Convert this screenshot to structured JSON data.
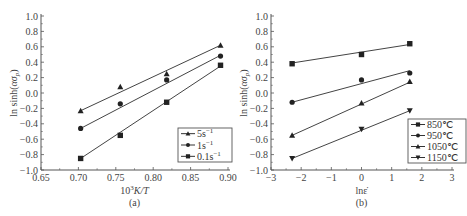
{
  "chart_data": [
    {
      "type": "scatter",
      "panel_label": "(a)",
      "title": "",
      "xlabel": "10^3 K/T",
      "ylabel": "ln sinh(ασp)",
      "xlim": [
        0.65,
        0.9
      ],
      "ylim": [
        -1.0,
        1.0
      ],
      "xticks": [
        "0.65",
        "0.70",
        "0.75",
        "0.80",
        "0.85",
        "0.90"
      ],
      "yticks": [
        "-1.0",
        "-0.8",
        "-0.6",
        "-0.4",
        "-0.2",
        "0.0",
        "0.2",
        "0.4",
        "0.6",
        "0.8",
        "1.0"
      ],
      "x": [
        0.703,
        0.756,
        0.818,
        0.89
      ],
      "series": [
        {
          "name": "5s-1",
          "marker": "triangle-up",
          "values": [
            -0.23,
            0.08,
            0.25,
            0.62
          ],
          "fit": [
            -0.23,
            0.02,
            0.31,
            0.62
          ]
        },
        {
          "name": "1s-1",
          "marker": "circle",
          "values": [
            -0.46,
            -0.14,
            0.17,
            0.48
          ],
          "fit": [
            -0.46,
            -0.19,
            0.14,
            0.49
          ]
        },
        {
          "name": "0.1s-1",
          "marker": "square",
          "values": [
            -0.85,
            -0.55,
            -0.12,
            0.36
          ],
          "fit": [
            -0.85,
            -0.54,
            -0.15,
            0.35
          ]
        }
      ],
      "legend_position": "lower right",
      "grid": false
    },
    {
      "type": "scatter",
      "panel_label": "(b)",
      "title": "",
      "xlabel": "lnε̇",
      "ylabel": "ln sinh(ασp)",
      "xlim": [
        -3,
        3
      ],
      "ylim": [
        -1.0,
        1.0
      ],
      "xticks": [
        "-3",
        "-2",
        "-1",
        "0",
        "1",
        "2",
        "3"
      ],
      "yticks": [
        "-1.0",
        "-0.8",
        "-0.6",
        "-0.4",
        "-0.2",
        "0.0",
        "0.2",
        "0.4",
        "0.6",
        "0.8",
        "1.0"
      ],
      "x": [
        -2.3,
        0.0,
        1.6
      ],
      "series": [
        {
          "name": "850℃",
          "marker": "square",
          "values": [
            0.38,
            0.5,
            0.64
          ],
          "fit": [
            0.39,
            0.53,
            0.63
          ]
        },
        {
          "name": "950℃",
          "marker": "circle",
          "values": [
            -0.12,
            0.17,
            0.26
          ],
          "fit": [
            -0.12,
            0.13,
            0.29
          ]
        },
        {
          "name": "1050℃",
          "marker": "triangle-up",
          "values": [
            -0.55,
            -0.13,
            0.15
          ],
          "fit": [
            -0.55,
            -0.15,
            0.14
          ]
        },
        {
          "name": "1150℃",
          "marker": "triangle-down",
          "values": [
            -0.85,
            -0.47,
            -0.23
          ],
          "fit": [
            -0.85,
            -0.47,
            -0.23
          ]
        }
      ],
      "legend_position": "lower right",
      "grid": false
    }
  ],
  "labels": {
    "a_panel": "(a)",
    "b_panel": "(b)",
    "a_xlabel_prefix": "10",
    "a_xlabel_sup": "3",
    "a_xlabel_rest": "K/T",
    "b_xlabel": "lnε̇",
    "ylabel_main": "ln sinh(",
    "ylabel_greek": "ασ",
    "ylabel_sub": "p",
    "ylabel_close": ")"
  }
}
